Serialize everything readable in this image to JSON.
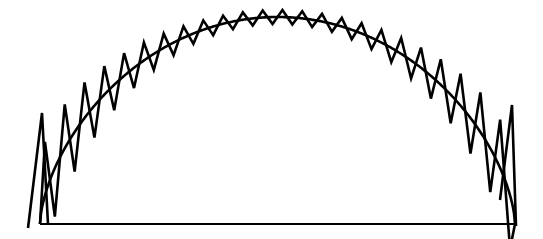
{
  "figure": {
    "title": "",
    "width": 543,
    "height": 239,
    "background_color": "#ffffff",
    "stroke_color": "#000000"
  },
  "chart_data": {
    "type": "line",
    "title": "",
    "subtitle": "",
    "xlabel": "",
    "ylabel": "",
    "xlim": [
      0,
      543
    ],
    "ylim": [
      239,
      0
    ],
    "grid": false,
    "legend": null,
    "axis_visible": false,
    "tick_labels_x": [],
    "tick_labels_y": [],
    "series": [
      {
        "name": "baseline",
        "kind": "polyline",
        "stroke": "#000000",
        "stroke_width": 2.2,
        "points": [
          [
            40,
            224
          ],
          [
            515,
            224
          ]
        ]
      },
      {
        "name": "smooth-arc",
        "kind": "arc",
        "stroke": "#000000",
        "stroke_width": 2.6,
        "arc_center_x": 277.5,
        "arc_base_y": 224,
        "arc_semi_width": 237.5,
        "arc_apex_y": 17,
        "arc_exponent": 0.62,
        "x_start": 40,
        "x_end": 515
      },
      {
        "name": "sawtooth-oscillation",
        "kind": "sawtooth",
        "stroke": "#000000",
        "stroke_width": 2.6,
        "teeth_count": 24,
        "period_px": 19.8,
        "x_start": 40,
        "x_end": 515,
        "amplitude_apex_px": 7,
        "amplitude_edge_px": 56,
        "amplitude_exponent": 2.6
      },
      {
        "name": "left-end-spike",
        "kind": "polyline",
        "stroke": "#000000",
        "stroke_width": 2.6,
        "points": [
          [
            28,
            228
          ],
          [
            42,
            113
          ],
          [
            48,
            224
          ]
        ]
      },
      {
        "name": "right-end-spike",
        "kind": "polyline",
        "stroke": "#000000",
        "stroke_width": 2.6,
        "points": [
          [
            500,
            200
          ],
          [
            512,
            105
          ],
          [
            516,
            226
          ]
        ]
      }
    ]
  }
}
